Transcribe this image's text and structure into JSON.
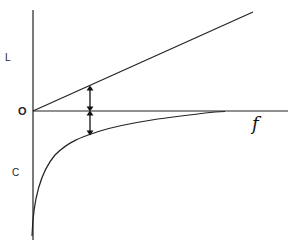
{
  "diagram": {
    "labels": {
      "upper": "L",
      "origin": "O",
      "lower": "C",
      "x_axis": "f"
    },
    "elements": {
      "inductive_line": "straight line rising from origin",
      "capacitive_curve": "hyperbolic curve below axis approaching zero",
      "double_arrows": "arrows marking difference between line and curve"
    }
  }
}
